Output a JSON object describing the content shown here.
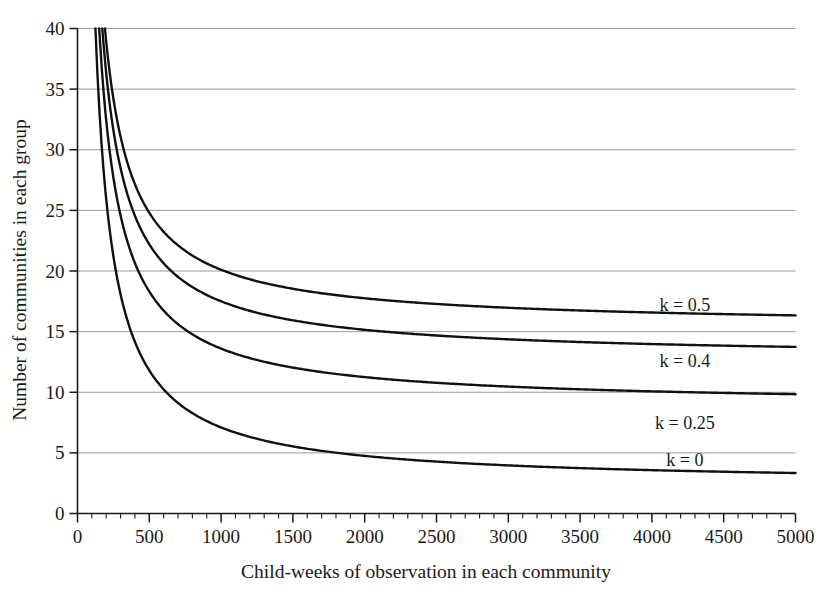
{
  "chart_data": {
    "type": "line",
    "title": "",
    "xlabel": "Child-weeks of observation in each community",
    "ylabel": "Number of communities in each group",
    "xlim": [
      0,
      5000
    ],
    "ylim": [
      0,
      40
    ],
    "grid": "horizontal",
    "legend_position": "inline-right",
    "x_ticks": [
      0,
      500,
      1000,
      1500,
      2000,
      2500,
      3000,
      3500,
      4000,
      4500,
      5000
    ],
    "x_tick_labels": [
      "0",
      "500",
      "1000",
      "1500",
      "2000",
      "2500",
      "3000",
      "3500",
      "4000",
      "4500",
      "5000"
    ],
    "x_minor_tick_interval": 100,
    "y_ticks": [
      0,
      5,
      10,
      15,
      20,
      25,
      30,
      35,
      40
    ],
    "y_tick_labels": [
      "0",
      "5",
      "10",
      "15",
      "20",
      "25",
      "30",
      "35",
      "40"
    ],
    "x": [
      150,
      200,
      250,
      300,
      350,
      400,
      450,
      500,
      600,
      700,
      800,
      900,
      1000,
      1100,
      1200,
      1300,
      1400,
      1500,
      1600,
      1700,
      1800,
      2000,
      2200,
      2400,
      2600,
      2800,
      3000,
      3200,
      3400,
      3600,
      3800,
      4000,
      4200,
      4400,
      4600,
      4800,
      5000
    ],
    "series": [
      {
        "name": "k = 0.5",
        "label": "k = 0.5",
        "k": 0.5,
        "asymptote": 15.3,
        "color": "#111111",
        "label_x": 4230,
        "label_y": 16.7,
        "values": [
          58.3,
          47.7,
          41.3,
          37.1,
          34.0,
          31.7,
          29.9,
          28.5,
          26.4,
          24.9,
          23.7,
          22.8,
          22.1,
          21.5,
          21.0,
          20.6,
          20.2,
          19.9,
          19.6,
          19.4,
          19.2,
          18.8,
          18.6,
          18.3,
          18.1,
          18.0,
          17.8,
          17.7,
          17.6,
          17.5,
          17.4,
          17.4,
          17.3,
          17.2,
          17.2,
          17.1,
          17.1
        ]
      },
      {
        "name": "k = 0.4",
        "label": "k = 0.4",
        "k": 0.4,
        "asymptote": 10.7,
        "color": "#111111",
        "label_x": 4230,
        "label_y": 12.1,
        "values": [
          53.7,
          43.1,
          36.7,
          32.5,
          29.4,
          27.1,
          25.3,
          23.9,
          21.8,
          20.3,
          19.1,
          18.2,
          17.5,
          16.9,
          16.4,
          16.0,
          15.6,
          15.3,
          15.0,
          14.8,
          14.6,
          14.2,
          14.0,
          13.7,
          13.5,
          13.4,
          13.2,
          13.1,
          13.0,
          12.9,
          12.8,
          12.8,
          12.7,
          12.6,
          12.6,
          12.5,
          12.5
        ]
      },
      {
        "name": "k = 0.25",
        "label": "k = 0.25",
        "k": 0.25,
        "asymptote": 5.6,
        "color": "#111111",
        "label_x": 4230,
        "label_y": 7.0,
        "values": [
          46.8,
          36.2,
          29.8,
          25.6,
          22.5,
          20.2,
          18.4,
          17.0,
          14.9,
          13.4,
          12.2,
          11.3,
          10.6,
          10.0,
          9.5,
          9.1,
          8.7,
          8.4,
          8.1,
          7.9,
          7.7,
          7.3,
          7.1,
          6.8,
          6.6,
          6.5,
          6.3,
          6.2,
          6.1,
          6.0,
          5.9,
          5.9,
          5.8,
          5.7,
          5.7,
          5.6,
          5.6
        ]
      },
      {
        "name": "k = 0",
        "label": "k = 0",
        "k": 0.0,
        "asymptote": 2.4,
        "color": "#111111",
        "label_x": 4230,
        "label_y": 3.9,
        "values": [
          35.3,
          24.7,
          18.3,
          14.1,
          11.0,
          8.7,
          6.9,
          5.5,
          3.4,
          1.9,
          0.7,
          0.0,
          0.0,
          0.0,
          0.0,
          0.0,
          0.0,
          0.0,
          0.0,
          0.0,
          0.0,
          0.0,
          0.0,
          0.0,
          0.0,
          0.0,
          0.0,
          0.0,
          0.0,
          0.0,
          0.0,
          0.0,
          0.0,
          0.0,
          0.0,
          0.0,
          0.0
        ]
      }
    ],
    "curve_model": {
      "description": "n = A/x + B*k + C",
      "A": 4700,
      "B": 26.0,
      "C": 2.4
    },
    "axis_colors": {
      "grid": "#8d8d8d",
      "axis": "#1a1a1a",
      "curve": "#111111"
    }
  }
}
